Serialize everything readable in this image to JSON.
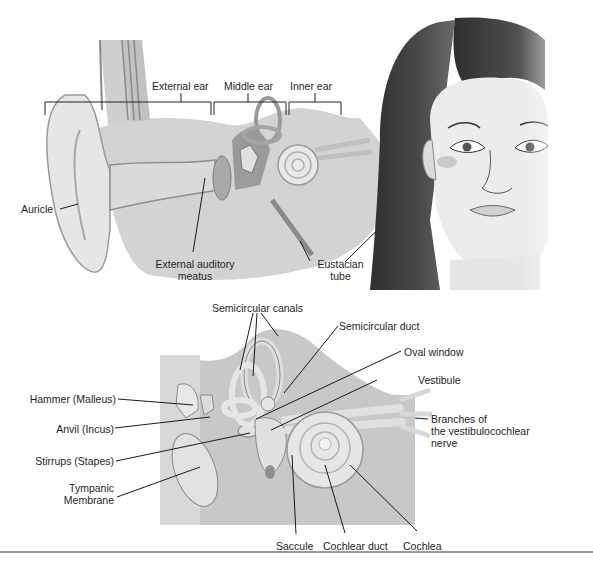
{
  "figure": {
    "top_panel": {
      "region_labels": [
        "External ear",
        "Middle ear",
        "Inner ear"
      ],
      "labels": {
        "auricle": "Auricle",
        "external_auditory_meatus": [
          "External auditory",
          "meatus"
        ],
        "eustachian_tube": [
          "Eustacian",
          "tube"
        ]
      }
    },
    "bottom_panel": {
      "labels": {
        "semicircular_canals": "Semicircular canals",
        "semicircular_duct": "Semicircular duct",
        "oval_window": "Oval window",
        "vestibule": "Vestibule",
        "hammer": "Hammer (Malleus)",
        "anvil": "Anvil (Incus)",
        "stirrups": "Stirrups (Stapes)",
        "tympanic": [
          "Tympanic",
          "Membrane"
        ],
        "branches": [
          "Branches of",
          "the vestibulocochlear",
          "nerve"
        ],
        "saccule": "Saccule",
        "cochlear_duct": "Cochlear duct",
        "cochlea": "Cochlea"
      }
    },
    "colors": {
      "tissue_light": "#dcdcdc",
      "tissue_mid": "#b8b8b8",
      "tissue_dark": "#8a8a8a",
      "line": "#1a1a1a",
      "hair": "#3a3a3a",
      "skin": "#ececec"
    }
  }
}
